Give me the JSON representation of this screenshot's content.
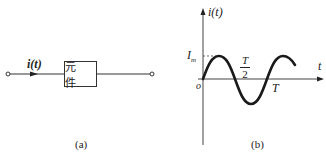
{
  "panel_a": {
    "current_label": "i(t)",
    "element_label": "元 件",
    "caption": "(a)"
  },
  "panel_b": {
    "y_axis_label": "i(t)",
    "x_axis_label": "t",
    "amplitude_label": "I",
    "amplitude_sub": "m",
    "origin_label": "o",
    "half_period_num": "T",
    "half_period_den": "2",
    "period_label": "T",
    "caption": "(b)"
  },
  "colors": {
    "stroke": "#222222",
    "background": "#ffffff"
  }
}
